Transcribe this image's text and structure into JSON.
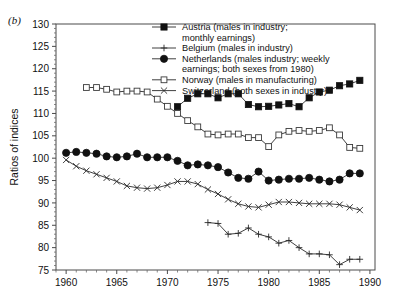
{
  "panel": {
    "label": "(b)"
  },
  "axes": {
    "ylabel": "Ratios of indices",
    "y_ticks": [
      75,
      80,
      85,
      90,
      95,
      100,
      105,
      110,
      115,
      120,
      125,
      130
    ],
    "ylim": [
      75,
      130
    ],
    "x_ticks": [
      1960,
      1965,
      1970,
      1975,
      1980,
      1985,
      1990
    ],
    "xlim": [
      1959,
      1990.5
    ],
    "x_minor_step": 1,
    "grid": false
  },
  "legend": {
    "position": "top-right-inside",
    "entries": [
      {
        "marker": "filled-square",
        "label": "Austria (males in industry;\nmonthly earnings)"
      },
      {
        "marker": "plus",
        "label": "Belgium (males in industry)"
      },
      {
        "marker": "filled-circle",
        "label": "Netherlands (males industry; weekly\nearnings; both sexes from 1980)"
      },
      {
        "marker": "open-square",
        "label": "Norway (males in manufacturing)"
      },
      {
        "marker": "cross",
        "label": "Switzerland (both sexes in industry)"
      }
    ]
  },
  "chart_data": {
    "type": "line",
    "title": "",
    "xlabel": "",
    "ylabel": "Ratios of indices",
    "xlim": [
      1959,
      1990.5
    ],
    "ylim": [
      75,
      130
    ],
    "grid": false,
    "series": [
      {
        "name": "Austria (males in industry; monthly earnings)",
        "marker": "filled-square",
        "color": "#111111",
        "x": [
          1971,
          1972,
          1973,
          1974,
          1975,
          1976,
          1977,
          1978,
          1979,
          1980,
          1981,
          1982,
          1983,
          1984,
          1985,
          1986,
          1987,
          1988,
          1989
        ],
        "values": [
          111.5,
          113.4,
          114.4,
          114.4,
          113.5,
          114.4,
          114.4,
          112.0,
          111.5,
          111.6,
          111.9,
          112.2,
          111.5,
          113.5,
          114.8,
          115.2,
          116.2,
          116.6,
          117.4
        ]
      },
      {
        "name": "Belgium (males in industry)",
        "marker": "plus",
        "color": "#2a2a2a",
        "x": [
          1974,
          1975,
          1976,
          1977,
          1978,
          1979,
          1980,
          1981,
          1982,
          1983,
          1984,
          1985,
          1986,
          1987,
          1988,
          1989
        ],
        "values": [
          85.6,
          85.4,
          83.0,
          83.2,
          84.4,
          83.0,
          82.4,
          81.0,
          81.6,
          80.0,
          78.6,
          78.6,
          78.4,
          76.2,
          77.4,
          77.4
        ]
      },
      {
        "name": "Netherlands (males industry; weekly earnings; both sexes from 1980)",
        "marker": "filled-circle",
        "color": "#111111",
        "x": [
          1960,
          1961,
          1962,
          1963,
          1964,
          1965,
          1966,
          1967,
          1968,
          1969,
          1970,
          1971,
          1972,
          1973,
          1974,
          1975,
          1976,
          1977,
          1978,
          1979,
          1980,
          1981,
          1982,
          1983,
          1984,
          1985,
          1986,
          1987,
          1988,
          1989
        ],
        "values": [
          101.2,
          101.4,
          101.2,
          101.0,
          100.4,
          100.2,
          100.4,
          101.0,
          100.2,
          100.2,
          100.2,
          99.4,
          98.4,
          98.6,
          98.4,
          98.0,
          96.8,
          95.6,
          95.4,
          97.0,
          95.0,
          95.2,
          95.4,
          95.4,
          95.6,
          95.2,
          94.8,
          95.2,
          96.6,
          96.6
        ]
      },
      {
        "name": "Norway (males in manufacturing)",
        "marker": "open-square",
        "color": "#3a3a3a",
        "x": [
          1962,
          1963,
          1964,
          1965,
          1966,
          1967,
          1968,
          1969,
          1970,
          1971,
          1972,
          1973,
          1974,
          1975,
          1976,
          1977,
          1978,
          1979,
          1980,
          1981,
          1982,
          1983,
          1984,
          1985,
          1986,
          1987,
          1988,
          1989
        ],
        "values": [
          115.8,
          115.8,
          115.4,
          114.8,
          115.0,
          115.0,
          114.8,
          113.2,
          111.6,
          110.0,
          108.4,
          107.0,
          105.4,
          105.2,
          105.4,
          105.4,
          104.6,
          104.6,
          102.6,
          105.2,
          106.0,
          106.2,
          106.0,
          106.2,
          106.8,
          105.2,
          102.4,
          102.2
        ]
      },
      {
        "name": "Switzerland (both sexes in industry)",
        "marker": "cross",
        "color": "#2a2a2a",
        "x": [
          1960,
          1961,
          1962,
          1963,
          1964,
          1965,
          1966,
          1967,
          1968,
          1969,
          1970,
          1971,
          1972,
          1973,
          1974,
          1975,
          1976,
          1977,
          1978,
          1979,
          1980,
          1981,
          1982,
          1983,
          1984,
          1985,
          1986,
          1987,
          1988,
          1989
        ],
        "values": [
          99.6,
          98.2,
          97.2,
          96.4,
          95.6,
          94.8,
          93.8,
          93.4,
          93.2,
          93.4,
          94.0,
          94.8,
          94.8,
          94.2,
          93.0,
          92.0,
          90.8,
          89.8,
          89.2,
          89.0,
          89.6,
          90.2,
          90.2,
          90.0,
          89.8,
          89.8,
          89.8,
          89.6,
          89.0,
          88.4
        ]
      }
    ]
  }
}
